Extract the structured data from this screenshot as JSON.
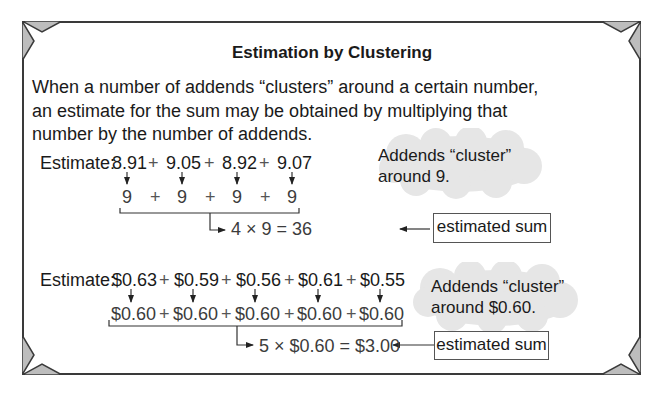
{
  "title": "Estimation by Clustering",
  "intro": [
    "When a number of addends “clusters” around a certain number,",
    "an estimate for the sum may be obtained by multiplying that",
    "number by the number of addends."
  ],
  "example1": {
    "label": "Estimate:",
    "addends": [
      "8.91",
      "9.05",
      "8.92",
      "9.07"
    ],
    "rounded": [
      "9",
      "9",
      "9",
      "9"
    ],
    "plus": "+",
    "result": "4 × 9 = 36",
    "cloud_text": [
      "Addends “cluster”",
      "around 9."
    ],
    "box_label": "estimated sum"
  },
  "example2": {
    "label": "Estimate:",
    "addends": [
      "$0.63",
      "$0.59",
      "$0.56",
      "$0.61",
      "$0.55"
    ],
    "rounded": [
      "$0.60",
      "$0.60",
      "$0.60",
      "$0.60",
      "$0.60"
    ],
    "plus": "+",
    "result": "5 × $0.60 = $3.00",
    "cloud_text": [
      "Addends “cluster”",
      "around $0.60."
    ],
    "box_label": "estimated sum"
  },
  "colors": {
    "frame": "#3a3a3a",
    "corner_fill": "#bdbdbd",
    "cloud": "#e6e6e6"
  }
}
